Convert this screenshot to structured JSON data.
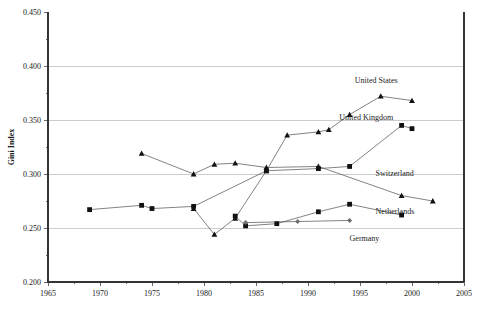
{
  "chart_data": {
    "type": "line",
    "title": "",
    "xlabel": "",
    "ylabel": "Gini Index",
    "xlim": [
      1965,
      2005
    ],
    "ylim": [
      0.2,
      0.45
    ],
    "grid": true,
    "grid_axis": "y",
    "legend": "inline-labels",
    "x_ticks": [
      1965,
      1970,
      1975,
      1980,
      1985,
      1990,
      1995,
      2000,
      2005
    ],
    "x_tick_labels": [
      "1965",
      "1970",
      "1975",
      "1980",
      "1985",
      "1990",
      "1995",
      "2000",
      "2005"
    ],
    "x_minor_step": 2.5,
    "y_ticks": [
      0.2,
      0.25,
      0.3,
      0.35,
      0.4,
      0.45
    ],
    "y_tick_labels": [
      "0.200",
      "0.250",
      "0.300",
      "0.350",
      "0.400",
      "0.450"
    ],
    "y_minor_step": 0.025,
    "series": [
      {
        "name": "United States",
        "marker": "triangle",
        "marker_color": "#111111",
        "label_x": 1994.5,
        "label_y": 0.384,
        "points": [
          {
            "x": 1979,
            "y": 0.268
          },
          {
            "x": 1981,
            "y": 0.244
          },
          {
            "x": 1983,
            "y": 0.259
          },
          {
            "x": 1986,
            "y": 0.303
          },
          {
            "x": 1988,
            "y": 0.336
          },
          {
            "x": 1991,
            "y": 0.339
          },
          {
            "x": 1992,
            "y": 0.341
          },
          {
            "x": 1994,
            "y": 0.355
          },
          {
            "x": 1997,
            "y": 0.372
          },
          {
            "x": 2000,
            "y": 0.368
          }
        ]
      },
      {
        "name": "United Kingdom",
        "marker": "square",
        "marker_color": "#111111",
        "label_x": 1993.0,
        "label_y": 0.35,
        "points": [
          {
            "x": 1969,
            "y": 0.267
          },
          {
            "x": 1974,
            "y": 0.271
          },
          {
            "x": 1975,
            "y": 0.268
          },
          {
            "x": 1979,
            "y": 0.27
          },
          {
            "x": 1986,
            "y": 0.303
          },
          {
            "x": 1991,
            "y": 0.305
          },
          {
            "x": 1994,
            "y": 0.307
          },
          {
            "x": 1999,
            "y": 0.345
          },
          {
            "x": 2000,
            "y": 0.342
          }
        ]
      },
      {
        "name": "Switzerland",
        "marker": "triangle",
        "marker_color": "#111111",
        "label_x": 1996.5,
        "label_y": 0.298,
        "points": [
          {
            "x": 1974,
            "y": 0.319
          },
          {
            "x": 1979,
            "y": 0.3
          },
          {
            "x": 1981,
            "y": 0.309
          },
          {
            "x": 1983,
            "y": 0.31
          },
          {
            "x": 1986,
            "y": 0.306
          },
          {
            "x": 1991,
            "y": 0.307
          },
          {
            "x": 1999,
            "y": 0.28
          },
          {
            "x": 2002,
            "y": 0.275
          }
        ]
      },
      {
        "name": "Netherlands",
        "marker": "square",
        "marker_color": "#111111",
        "label_x": 1996.5,
        "label_y": 0.263,
        "points": [
          {
            "x": 1983,
            "y": 0.261
          },
          {
            "x": 1984,
            "y": 0.252
          },
          {
            "x": 1987,
            "y": 0.254
          },
          {
            "x": 1991,
            "y": 0.265
          },
          {
            "x": 1994,
            "y": 0.272
          },
          {
            "x": 1999,
            "y": 0.262
          }
        ]
      },
      {
        "name": "Germany",
        "marker": "diamond",
        "marker_color": "#6e6e6e",
        "label_x": 1994.0,
        "label_y": 0.238,
        "points": [
          {
            "x": 1984,
            "y": 0.255
          },
          {
            "x": 1989,
            "y": 0.256
          },
          {
            "x": 1994,
            "y": 0.257
          }
        ]
      }
    ]
  }
}
